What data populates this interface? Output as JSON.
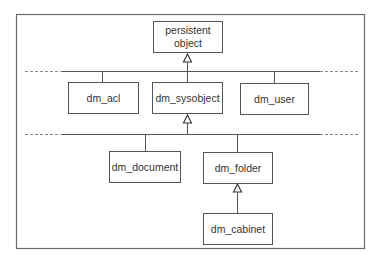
{
  "diagram": {
    "type": "class-hierarchy",
    "nodes": [
      {
        "id": "persistent_object",
        "lines": [
          "persistent",
          "object"
        ]
      },
      {
        "id": "dm_acl",
        "lines": [
          "dm_acl"
        ]
      },
      {
        "id": "dm_sysobject",
        "lines": [
          "dm_sysobject"
        ]
      },
      {
        "id": "dm_user",
        "lines": [
          "dm_user"
        ]
      },
      {
        "id": "dm_document",
        "lines": [
          "dm_document"
        ]
      },
      {
        "id": "dm_folder",
        "lines": [
          "dm_folder"
        ]
      },
      {
        "id": "dm_cabinet",
        "lines": [
          "dm_cabinet"
        ]
      }
    ],
    "edges": [
      {
        "from": "dm_acl",
        "to": "persistent_object",
        "kind": "inheritance"
      },
      {
        "from": "dm_sysobject",
        "to": "persistent_object",
        "kind": "inheritance"
      },
      {
        "from": "dm_user",
        "to": "persistent_object",
        "kind": "inheritance"
      },
      {
        "from": "dm_document",
        "to": "dm_sysobject",
        "kind": "inheritance"
      },
      {
        "from": "dm_folder",
        "to": "dm_sysobject",
        "kind": "inheritance"
      },
      {
        "from": "dm_cabinet",
        "to": "dm_folder",
        "kind": "inheritance"
      }
    ]
  }
}
